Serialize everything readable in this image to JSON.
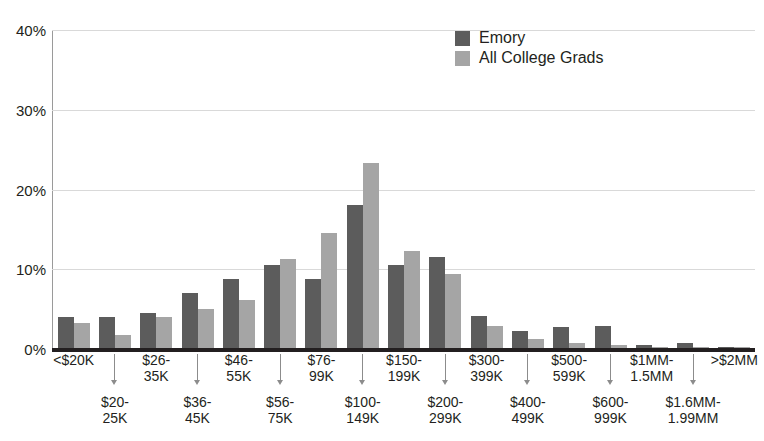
{
  "chart_data": {
    "type": "bar",
    "title": "",
    "xlabel": "",
    "ylabel": "",
    "ylim": [
      0,
      40
    ],
    "y_ticks": [
      "0%",
      "10%",
      "20%",
      "30%",
      "40%"
    ],
    "y_tick_values": [
      0,
      10,
      20,
      30,
      40
    ],
    "grid": true,
    "legend_position": "top-right",
    "categories": [
      "<$20K",
      "$20-\n25K",
      "$26-\n35K",
      "$36-\n45K",
      "$46-\n55K",
      "$56-\n75K",
      "$76-\n99K",
      "$100-\n149K",
      "$150-\n199K",
      "$200-\n299K",
      "$300-\n399K",
      "$400-\n499K",
      "$500-\n599K",
      "$600-\n999K",
      "$1MM-\n1.5MM",
      "$1.6MM-\n1.99MM",
      ">$2MM"
    ],
    "series": [
      {
        "name": "Emory",
        "color": "#5c5c5c",
        "values": [
          4.0,
          4.0,
          4.5,
          7.0,
          8.8,
          10.5,
          8.8,
          18.1,
          10.5,
          11.6,
          4.2,
          2.2,
          2.8,
          2.9,
          0.5,
          0.7,
          0.2
        ]
      },
      {
        "name": "All College Grads",
        "color": "#a5a5a5",
        "values": [
          3.2,
          1.8,
          4.0,
          5.0,
          6.1,
          11.3,
          14.6,
          23.3,
          12.3,
          9.4,
          2.9,
          1.3,
          0.8,
          0.5,
          0.2,
          0.2,
          0.2
        ]
      }
    ]
  },
  "legend": {
    "items": [
      {
        "label": "Emory",
        "color": "#5c5c5c"
      },
      {
        "label": "All College Grads",
        "color": "#a5a5a5"
      }
    ]
  },
  "axis": {
    "y_ticks": [
      {
        "label": "40%",
        "value": 40
      },
      {
        "label": "30%",
        "value": 30
      },
      {
        "label": "20%",
        "value": 20
      },
      {
        "label": "10%",
        "value": 10
      },
      {
        "label": "0%",
        "value": 0
      }
    ],
    "x_upper": [
      "<$20K",
      "$26-\n35K",
      "$46-\n55K",
      "$76-\n99K",
      "$150-\n199K",
      "$300-\n399K",
      "$500-\n599K",
      "$1MM-\n1.5MM",
      ">$2MM"
    ],
    "x_lower": [
      "$20-\n25K",
      "$36-\n45K",
      "$56-\n75K",
      "$100-\n149K",
      "$200-\n299K",
      "$400-\n499K",
      "$600-\n999K",
      "$1.6MM-\n1.99MM"
    ]
  },
  "colors": {
    "emory": "#5c5c5c",
    "grads": "#a5a5a5",
    "grid": "#d9d9d9",
    "axis": "#231f20",
    "background": "#ffffff"
  }
}
